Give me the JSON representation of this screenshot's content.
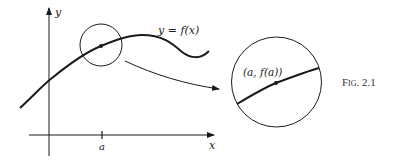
{
  "figure": {
    "caption": "Fig. 2.1",
    "curve_label": "y = f(x)",
    "point_label": "(a, f(a))",
    "axes": {
      "x_label": "x",
      "y_label": "y",
      "tick_label": "a"
    },
    "colors": {
      "ink": "#1a1a1a",
      "background": "#ffffff"
    }
  }
}
